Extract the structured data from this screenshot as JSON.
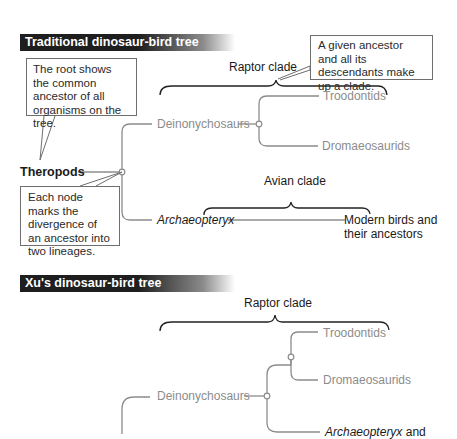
{
  "traditional_tree": {
    "header": "Traditional dinosaur-bird tree",
    "root_label": "Theropods",
    "nodes": {
      "deinonychosaurs": "Deinonychosaurs",
      "troodontids": "Troodontids",
      "dromaeosaurids": "Dromaeosaurids",
      "archaeopteryx": "Archaeopteryx",
      "modern_birds_line1": "Modern birds and",
      "modern_birds_line2": "their ancestors"
    },
    "clades": {
      "raptor": "Raptor clade",
      "avian": "Avian clade"
    },
    "callouts": {
      "root": "The root shows the common ancestor of all organisms on the tree.",
      "clade": "A given ancestor and all its descendants make up a clade.",
      "node": "Each node marks the divergence of an ancestor into two lineages."
    }
  },
  "xu_tree": {
    "header": "Xu's dinosaur-bird tree",
    "nodes": {
      "deinonychosaurs": "Deinonychosaurs",
      "troodontids": "Troodontids",
      "dromaeosaurids": "Dromaeosaurids",
      "archaeopteryx": "Archaeopteryx",
      "archaeopteryx_suffix": " and"
    },
    "clades": {
      "raptor": "Raptor clade"
    }
  },
  "colors": {
    "header_bg": "#1e1e1e",
    "branch_gray": "#8c8c8c",
    "text_black": "#1a1a1a",
    "callout_border": "#6e6e6e"
  }
}
